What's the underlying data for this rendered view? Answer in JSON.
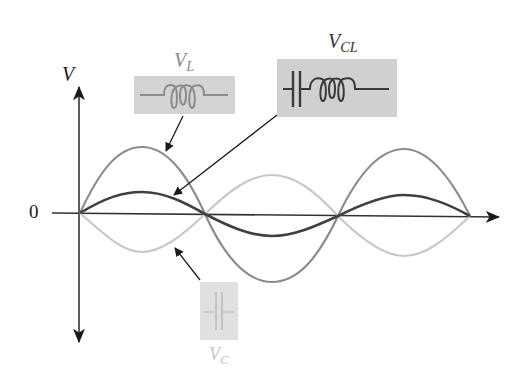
{
  "diagram": {
    "type": "waveform",
    "axes": {
      "y_label": "V",
      "y_label_main": "V",
      "zero_label": "0"
    },
    "labels": {
      "vl": {
        "main": "V",
        "sub": "L"
      },
      "vcl": {
        "main": "V",
        "sub": "CL"
      },
      "vc": {
        "main": "V",
        "sub": "C"
      }
    },
    "components": {
      "vl_box": "inductor-symbol",
      "vcl_box": "capacitor-and-inductor-series-symbol",
      "vc_box": "capacitor-symbol"
    },
    "curves": [
      {
        "name": "V_L",
        "amplitude": 1.0,
        "phase_deg": 0,
        "color": "#8c8c8c",
        "width": 2.2
      },
      {
        "name": "V_CL",
        "amplitude": 0.33,
        "phase_deg": 0,
        "color": "#404040",
        "width": 2.6
      },
      {
        "name": "V_C",
        "amplitude": 0.58,
        "phase_deg": 180,
        "color": "#c8c8c8",
        "width": 2.2
      }
    ],
    "cycles_shown": 1.5,
    "colors": {
      "axis": "#333333",
      "vl": "#8c8c8c",
      "vcl": "#404040",
      "vc": "#c8c8c8",
      "box_vl": "#d3d3d3",
      "box_vcl": "#d0d0d0",
      "box_vc": "#e0e0e0"
    }
  }
}
